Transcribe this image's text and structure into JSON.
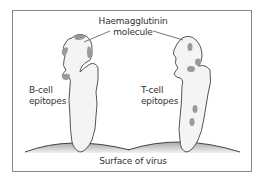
{
  "diagram": {
    "title_label": {
      "line1": "Haemagglutinin",
      "line2": "molecule"
    },
    "left_panel": {
      "label_line1": "B-cell",
      "label_line2": "epitopes"
    },
    "right_panel": {
      "label_line1": "T-cell",
      "label_line2": "epitopes"
    },
    "bottom_label": "Surface of virus",
    "colors": {
      "outline": "#555555",
      "molecule_fill": "#f4f4f4",
      "epitope": "#9a9a9a",
      "virus_surface_dark": "#9c9c9c",
      "virus_surface_light": "#f0f0f0",
      "frame_border": "#8a8a8a"
    }
  }
}
